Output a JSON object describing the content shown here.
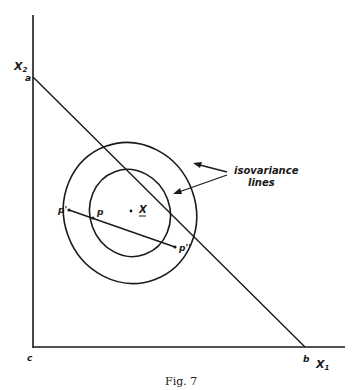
{
  "figure": {
    "caption": "Fig. 7",
    "axes": {
      "y_axis_label": "X",
      "y_axis_sub": "2",
      "x_axis_label": "X",
      "x_axis_sub": "1"
    },
    "points": {
      "a": "a",
      "b": "b",
      "c": "c",
      "p_prime": "p'",
      "p": "p",
      "p_double_prime": "p''",
      "x_center": "X"
    },
    "annotation": {
      "line1": "isovariance",
      "line2": "lines"
    }
  }
}
